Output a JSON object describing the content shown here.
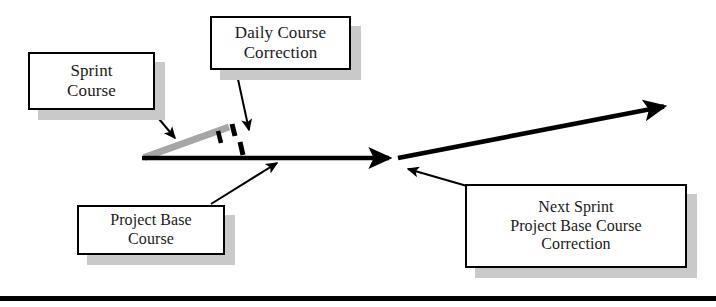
{
  "diagram": {
    "type": "flow-diagram",
    "background_color": "#ffffff",
    "stroke_color": "#000000",
    "sprint_course_color": "#a6a6a6",
    "shadow_color": "#c9c9c9",
    "boxes": [
      {
        "id": "sprint-course",
        "lines": [
          "Sprint",
          "Course"
        ],
        "line1": "Sprint",
        "line2": "Course"
      },
      {
        "id": "daily-course-correction",
        "lines": [
          "Daily Course",
          "Correction"
        ],
        "line1": "Daily Course",
        "line2": "Correction"
      },
      {
        "id": "project-base-course",
        "lines": [
          "Project Base",
          "Course"
        ],
        "line1": "Project Base",
        "line2": "Course"
      },
      {
        "id": "next-sprint-project-base-course-correction",
        "lines": [
          "Next Sprint",
          "Project Base Course",
          "Correction"
        ],
        "line1": "Next Sprint",
        "line2": "Project Base Course",
        "line3": "Correction"
      }
    ],
    "arrows": [
      {
        "id": "project-base-course-arrow",
        "description": "thick horizontal base course arrow pointing right",
        "from": [
          142,
          158
        ],
        "to": [
          397,
          158
        ]
      },
      {
        "id": "next-sprint-course-arrow",
        "description": "thick arrow angling up to the right from the base course end",
        "from": [
          397,
          158
        ],
        "to": [
          672,
          105
        ]
      },
      {
        "id": "sprint-course-line",
        "description": "gray sprint course line rising from base to the right",
        "from": [
          145,
          157
        ],
        "to": [
          228,
          128
        ]
      },
      {
        "id": "daily-correction-dashes",
        "description": "black dashed tick marks crossing the sprint course line"
      },
      {
        "id": "sprint-course-leader",
        "description": "leader arrow from Sprint Course box to the gray sprint line",
        "from": [
          150,
          108
        ],
        "to": [
          176,
          139
        ]
      },
      {
        "id": "daily-course-correction-leader",
        "description": "leader arrow from Daily Course Correction box down to the dashes",
        "from": [
          237,
          71
        ],
        "to": [
          250,
          132
        ]
      },
      {
        "id": "project-base-course-leader",
        "description": "leader arrow from Project Base Course box up to the base line",
        "from": [
          212,
          205
        ],
        "to": [
          278,
          163
        ]
      },
      {
        "id": "next-sprint-leader",
        "description": "leader arrow from Next Sprint box up-left to the course junction",
        "from": [
          467,
          185
        ],
        "to": [
          407,
          169
        ]
      }
    ],
    "footer_rule": {
      "present": true,
      "color": "#000000"
    }
  }
}
